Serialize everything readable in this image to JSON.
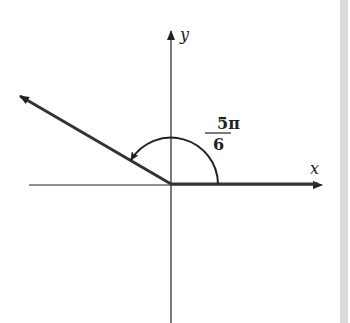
{
  "diagram": {
    "axes": {
      "x_label": "x",
      "y_label": "y"
    },
    "angle": {
      "numerator": "5π",
      "denominator": "6",
      "radians": "5π/6",
      "degrees": 150
    },
    "colors": {
      "ink": "#222222",
      "side_bar": "#d9d9d9",
      "background": "#ffffff"
    }
  }
}
